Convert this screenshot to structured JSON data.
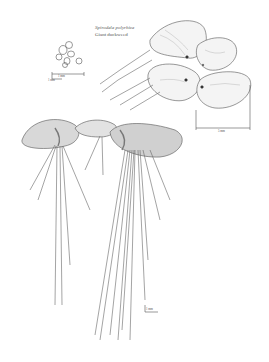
{
  "illustration": {
    "title_scientific": "Spirodela polyrhiza",
    "title_common": "Giant duckweed",
    "style": "pen-and-ink botanical illustration",
    "stroke_color": "#555555",
    "fill_color": "#e6e6e6",
    "shade_color": "#999999",
    "background": "#ffffff"
  },
  "scale_bars": [
    {
      "name": "seeds-scale",
      "label_top": "1 mm",
      "label_bottom": "1 mm"
    },
    {
      "name": "frond-scale",
      "label": "5 mm"
    },
    {
      "name": "roots-scale",
      "label": "1 mm"
    }
  ],
  "parts": [
    "seed-cluster",
    "frond-cluster-top-view",
    "fronds-side-view",
    "roots"
  ]
}
